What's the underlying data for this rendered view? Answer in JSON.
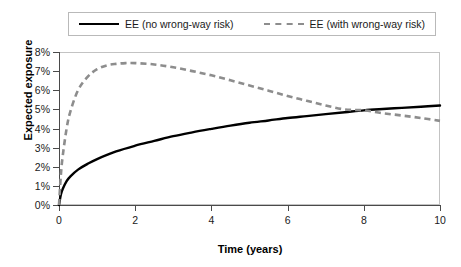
{
  "chart_data": {
    "type": "line",
    "title": "",
    "xlabel": "Time (years)",
    "ylabel": "Expected exposure",
    "xlim": [
      0,
      10
    ],
    "ylim": [
      0,
      8
    ],
    "grid": false,
    "legend_position": "top",
    "x_ticks": [
      "0",
      "2",
      "4",
      "6",
      "8",
      "10"
    ],
    "x_tick_values": [
      0,
      2,
      4,
      6,
      8,
      10
    ],
    "y_ticks": [
      "0%",
      "1%",
      "2%",
      "3%",
      "4%",
      "5%",
      "6%",
      "7%",
      "8%"
    ],
    "y_tick_values": [
      0,
      1,
      2,
      3,
      4,
      5,
      6,
      7,
      8
    ],
    "y_unit": "%",
    "series": [
      {
        "name": "EE (no wrong-way risk)",
        "style": "solid",
        "color": "#000000",
        "x": [
          0,
          0.05,
          0.1,
          0.2,
          0.3,
          0.5,
          0.75,
          1.0,
          1.5,
          2.0,
          2.5,
          3.0,
          3.5,
          4.0,
          4.5,
          5.0,
          5.5,
          6.0,
          6.5,
          7.0,
          7.5,
          8.0,
          8.5,
          9.0,
          9.5,
          10.0
        ],
        "values": [
          0.0,
          0.55,
          0.85,
          1.25,
          1.5,
          1.85,
          2.15,
          2.4,
          2.8,
          3.1,
          3.35,
          3.6,
          3.8,
          3.98,
          4.15,
          4.3,
          4.42,
          4.55,
          4.65,
          4.75,
          4.85,
          4.95,
          5.02,
          5.08,
          5.14,
          5.2
        ]
      },
      {
        "name": "EE (with wrong-way risk)",
        "style": "dashed",
        "color": "#8d8d8d",
        "x": [
          0,
          0.05,
          0.1,
          0.2,
          0.3,
          0.5,
          0.75,
          1.0,
          1.25,
          1.5,
          1.75,
          2.0,
          2.5,
          3.0,
          3.5,
          4.0,
          4.5,
          5.0,
          5.5,
          6.0,
          6.5,
          7.0,
          7.5,
          8.0,
          8.5,
          9.0,
          9.5,
          10.0
        ],
        "values": [
          0.0,
          1.6,
          2.6,
          4.0,
          4.9,
          6.0,
          6.7,
          7.1,
          7.3,
          7.38,
          7.42,
          7.42,
          7.35,
          7.2,
          7.0,
          6.78,
          6.52,
          6.25,
          5.98,
          5.7,
          5.45,
          5.2,
          5.0,
          4.95,
          4.8,
          4.68,
          4.55,
          4.4
        ]
      }
    ],
    "annotations": {
      "crossover_x": 8.05,
      "crossover_y": 4.97,
      "peak_wwr_x": 1.85,
      "peak_wwr_y": 7.42
    }
  },
  "legend": {
    "entries": [
      {
        "label": "EE (no wrong-way risk)",
        "style": "solid"
      },
      {
        "label": "EE (with wrong-way risk)",
        "style": "dashed"
      }
    ]
  },
  "colors": {
    "series_solid": "#000000",
    "series_dashed": "#8d8d8d",
    "axis": "#4a4a4a",
    "frame": "#c3c3c3",
    "text": "#1a1a1a",
    "background": "#ffffff"
  }
}
